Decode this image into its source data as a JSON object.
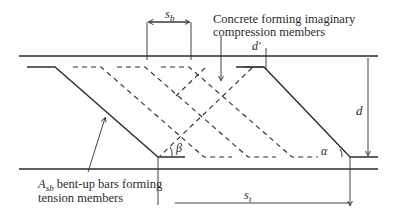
{
  "diagram": {
    "type": "truss-analogy-bent-up-bars",
    "labels": {
      "compression_note_line1": "Concrete forming imaginary",
      "compression_note_line2": "compression members",
      "tension_note_prefix": "A",
      "tension_note_sub": "sb",
      "tension_note_line1_rest": " bent-up bars forming",
      "tension_note_line2": "tension members",
      "sb_main": "s",
      "sb_sub": "b",
      "st_main": "s",
      "st_sub": "t",
      "d_prime": "d'",
      "d": "d",
      "alpha": "α",
      "beta": "β"
    },
    "colors": {
      "line": "#2b2b2b",
      "text": "#2a2a2a"
    }
  }
}
